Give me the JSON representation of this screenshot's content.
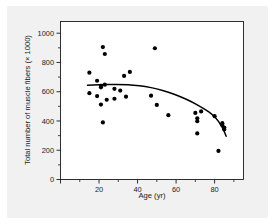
{
  "figure": {
    "background_color": "#f1f1f1",
    "plot_background_color": "#ffffff",
    "axis_color": "#1a1a1a",
    "point_color": "#000000",
    "curve_color": "#000000"
  },
  "chart_data": {
    "type": "scatter",
    "title": "",
    "subtitle": "",
    "xlabel": "Age (yr)",
    "ylabel": "Total number of muscle fibers (× 1000)",
    "xlim": [
      0,
      95
    ],
    "ylim": [
      0,
      1080
    ],
    "grid": false,
    "legend": null,
    "legend_position": "none",
    "xticks": [
      0,
      20,
      40,
      60,
      80
    ],
    "xtick_labels": [
      "",
      "20",
      "40",
      "60",
      "80"
    ],
    "xticks_minor": [
      10,
      30,
      50,
      70,
      90
    ],
    "yticks": [
      0,
      200,
      400,
      600,
      800,
      1000
    ],
    "ytick_labels": [
      "0",
      "200",
      "400",
      "600",
      "800",
      "1000"
    ],
    "yticks_minor": [
      100,
      300,
      500,
      700,
      900
    ],
    "series": [
      {
        "name": "Muscle fiber count vs age",
        "marker": "filled-circle",
        "points": [
          {
            "x": 15,
            "y": 730
          },
          {
            "x": 15,
            "y": 590
          },
          {
            "x": 19,
            "y": 675
          },
          {
            "x": 19,
            "y": 570
          },
          {
            "x": 21,
            "y": 640
          },
          {
            "x": 21,
            "y": 630
          },
          {
            "x": 21,
            "y": 512
          },
          {
            "x": 22,
            "y": 905
          },
          {
            "x": 22,
            "y": 390
          },
          {
            "x": 23,
            "y": 858
          },
          {
            "x": 23,
            "y": 648
          },
          {
            "x": 24,
            "y": 545
          },
          {
            "x": 28,
            "y": 620
          },
          {
            "x": 28,
            "y": 552
          },
          {
            "x": 31,
            "y": 608
          },
          {
            "x": 33,
            "y": 708
          },
          {
            "x": 34,
            "y": 566
          },
          {
            "x": 36,
            "y": 735
          },
          {
            "x": 47,
            "y": 573
          },
          {
            "x": 49,
            "y": 897
          },
          {
            "x": 50,
            "y": 510
          },
          {
            "x": 56,
            "y": 440
          },
          {
            "x": 70,
            "y": 455
          },
          {
            "x": 71,
            "y": 418
          },
          {
            "x": 71,
            "y": 398
          },
          {
            "x": 71,
            "y": 315
          },
          {
            "x": 73,
            "y": 465
          },
          {
            "x": 80,
            "y": 433
          },
          {
            "x": 82,
            "y": 195
          },
          {
            "x": 84,
            "y": 385
          },
          {
            "x": 84,
            "y": 372
          },
          {
            "x": 85,
            "y": 355
          },
          {
            "x": 85,
            "y": 342
          }
        ]
      }
    ],
    "fit_curve": {
      "name": "fitted trend",
      "style": "solid",
      "points": [
        {
          "x": 14,
          "y": 645
        },
        {
          "x": 20,
          "y": 648
        },
        {
          "x": 26,
          "y": 650
        },
        {
          "x": 32,
          "y": 650
        },
        {
          "x": 38,
          "y": 646
        },
        {
          "x": 44,
          "y": 636
        },
        {
          "x": 50,
          "y": 620
        },
        {
          "x": 56,
          "y": 598
        },
        {
          "x": 62,
          "y": 568
        },
        {
          "x": 68,
          "y": 532
        },
        {
          "x": 74,
          "y": 488
        },
        {
          "x": 80,
          "y": 435
        },
        {
          "x": 84,
          "y": 360
        },
        {
          "x": 86,
          "y": 295
        }
      ]
    }
  }
}
